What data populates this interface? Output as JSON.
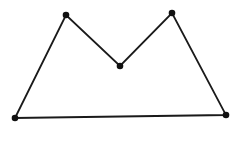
{
  "diagram": {
    "type": "polygon",
    "stroke_color": "#1a1a1a",
    "vertex_color": "#111111",
    "background": "#ffffff",
    "vertices": [
      {
        "id": "bottom-left",
        "x": 15,
        "y": 118
      },
      {
        "id": "top-left",
        "x": 66,
        "y": 15
      },
      {
        "id": "middle",
        "x": 120,
        "y": 66
      },
      {
        "id": "top-right",
        "x": 172,
        "y": 13
      },
      {
        "id": "bottom-right",
        "x": 226,
        "y": 115
      }
    ]
  }
}
